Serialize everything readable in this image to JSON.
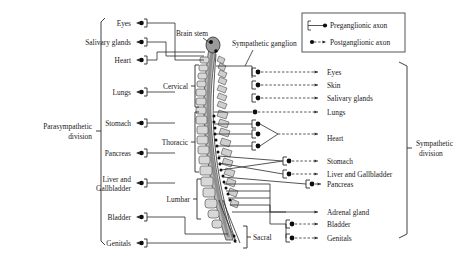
{
  "figure": {
    "colors": {
      "line": "#2a2a2a",
      "node": "#0d0d0d",
      "cord": "#b9b9b9",
      "vertebra": "#d8d8d8",
      "background": "#ffffff"
    }
  },
  "legend": {
    "items": [
      {
        "label": "Preganglionic axon",
        "style": "solid-with-terminal-dot",
        "icon": "preganglionic-axon-icon"
      },
      {
        "label": "Postganglionic axon",
        "style": "dashed-with-arrowhead",
        "icon": "postganglionic-axon-icon"
      }
    ]
  },
  "annotations": {
    "brain_stem": "Brain stem",
    "sympathetic_ganglion": "Sympathetic ganglion"
  },
  "divisions": {
    "left": {
      "line1": "Parasympathetic",
      "line2": "division"
    },
    "right": {
      "line1": "Sympathetic",
      "line2": "division"
    }
  },
  "spinal_regions": [
    {
      "name": "Cervical"
    },
    {
      "name": "Thoracic"
    },
    {
      "name": "Lumbar"
    },
    {
      "name": "Sacral"
    }
  ],
  "parasympathetic_targets": [
    {
      "label": "Eyes",
      "y": 23
    },
    {
      "label": "Salivary glands",
      "y": 42
    },
    {
      "label": "Heart",
      "y": 60
    },
    {
      "label": "Lungs",
      "y": 92
    },
    {
      "label": "Stomach",
      "y": 123
    },
    {
      "label": "Pancreas",
      "y": 153
    },
    {
      "label": "Liver and",
      "label2": "Gallbladder",
      "y": 183
    },
    {
      "label": "Bladder",
      "y": 217
    },
    {
      "label": "Genitals",
      "y": 243
    }
  ],
  "sympathetic_targets": [
    {
      "label": "Eyes",
      "y": 72
    },
    {
      "label": "Skin",
      "y": 85
    },
    {
      "label": "Salivary glands",
      "y": 98
    },
    {
      "label": "Lungs",
      "y": 112
    },
    {
      "label": "Heart",
      "y": 138
    },
    {
      "label": "Stomach",
      "y": 161
    },
    {
      "label": "Liver and Gallbladder",
      "y": 174
    },
    {
      "label": "Pancreas",
      "y": 184
    },
    {
      "label": "Adrenal gland",
      "y": 212
    },
    {
      "label": "Bladder",
      "y": 224
    },
    {
      "label": "Genitals",
      "y": 238
    }
  ]
}
